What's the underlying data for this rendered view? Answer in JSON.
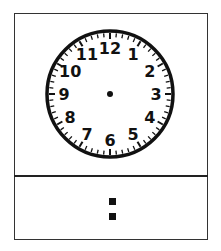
{
  "clock": {
    "numerals": [
      "12",
      "1",
      "2",
      "3",
      "4",
      "5",
      "6",
      "7",
      "8",
      "9",
      "10",
      "11"
    ],
    "tick_count": 60,
    "face_color": "#ffffff",
    "ink_color": "#111111",
    "hands_visible": false
  },
  "digital": {
    "hours": "",
    "separator": ":",
    "minutes": ""
  }
}
